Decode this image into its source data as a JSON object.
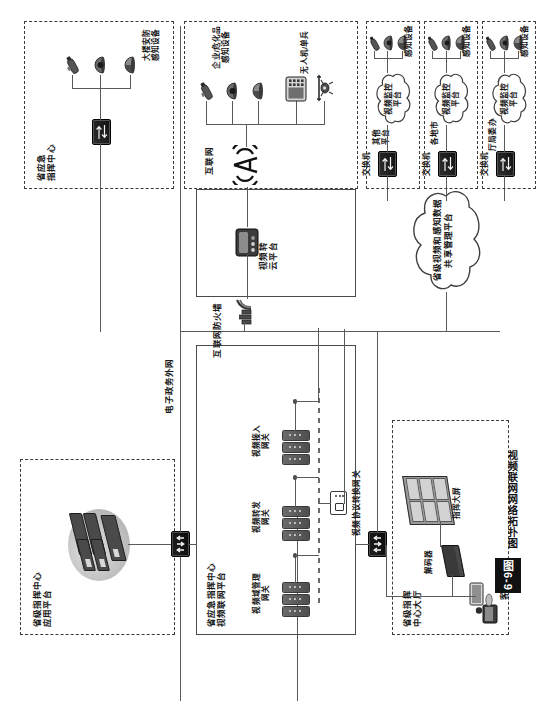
{
  "figure": {
    "tag": "图6-9",
    "caption": "视频联网网络拓扑图"
  },
  "zones": {
    "provincial_app_platform": {
      "label": "省级指挥中心\n应用平台"
    },
    "provincial_video_network_platform": {
      "label": "省应急指挥中心\n视频联网平台"
    },
    "provincial_command_hall": {
      "label": "省级指挥\n中心大厅"
    },
    "provincial_emergency_center": {
      "label": "省应急\n指挥中心"
    },
    "internet_zone": {
      "label": "互联网"
    },
    "other_platform": {
      "label": "其他\n平台"
    },
    "cities": {
      "label": "各地市"
    },
    "departments": {
      "label": "厅局委办"
    }
  },
  "networks": {
    "egov_extranet": "电子政务外网",
    "internet_firewall": "互联网防火墙",
    "internet": "互联网"
  },
  "nodes": {
    "server_cluster": "服务器集群",
    "video_domain_mgmt_gateway": "视频域管理\n网关",
    "video_forward_gateway": "视频转发\n网关",
    "video_access_gateway": "视频接入\n网关",
    "video_protocol_convert_gateway": "视频协议转换网关",
    "video_cloud_platform": "视频转\n云平台",
    "share_mgmt_platform": "省级视频和感知数据\n共享管理平台",
    "command_bigscreen": "指挥大屏",
    "decoder": "解码器",
    "client": "客户端",
    "switch": "交换机",
    "video_surveillance_platform": "视频监控\n平台",
    "sensing_devices": "感知设备",
    "building_security_sensing": "大楼安防\n感知设备",
    "enterprise_hazchem_sensing": "企业/危化品\n感知设备",
    "uav_soldier": "无人机/单兵"
  },
  "colors": {
    "line": "#5a5a5a",
    "dashed_border": "#3a3a3a",
    "solid_border": "#4a4a4a",
    "device_dark": "#2e2e2e",
    "text": "#1a1a1a"
  }
}
